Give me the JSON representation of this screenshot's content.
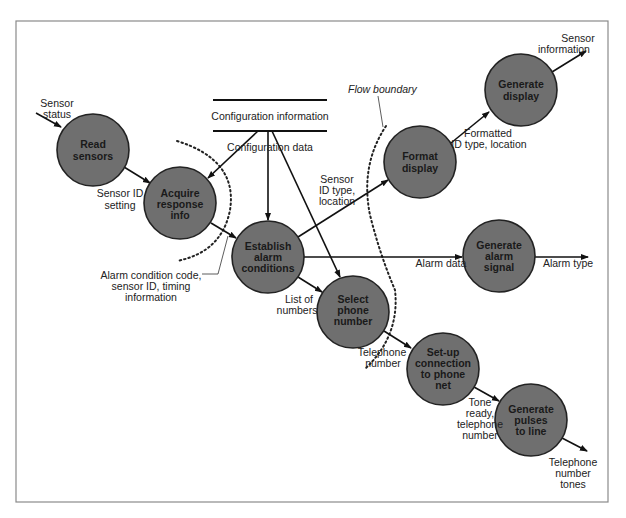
{
  "diagram": {
    "type": "data-flow-diagram",
    "processes": [
      {
        "id": "read_sensors",
        "lines": [
          "Read",
          "sensors"
        ],
        "cx": 93,
        "cy": 150
      },
      {
        "id": "acquire_response_info",
        "lines": [
          "Acquire",
          "response",
          "info"
        ],
        "cx": 180,
        "cy": 203
      },
      {
        "id": "establish_alarm_conditions",
        "lines": [
          "Establish",
          "alarm",
          "conditions"
        ],
        "cx": 268,
        "cy": 257
      },
      {
        "id": "select_phone_number",
        "lines": [
          "Select",
          "phone",
          "number"
        ],
        "cx": 353,
        "cy": 312
      },
      {
        "id": "format_display",
        "lines": [
          "Format",
          "display"
        ],
        "cx": 420,
        "cy": 162
      },
      {
        "id": "generate_display",
        "lines": [
          "Generate",
          "display"
        ],
        "cx": 521,
        "cy": 90
      },
      {
        "id": "generate_alarm_signal",
        "lines": [
          "Generate",
          "alarm",
          "signal"
        ],
        "cx": 499,
        "cy": 256
      },
      {
        "id": "setup_connection",
        "lines": [
          "Set-up",
          "connection",
          "to phone",
          "net"
        ],
        "cx": 443,
        "cy": 369
      },
      {
        "id": "generate_pulses",
        "lines": [
          "Generate",
          "pulses",
          "to line"
        ],
        "cx": 531,
        "cy": 420
      }
    ],
    "data_store": {
      "label": "Configuration information"
    },
    "flow_labels": {
      "sensor_status": [
        "Sensor",
        "status"
      ],
      "sensor_id_setting": [
        "Sensor ID",
        "setting"
      ],
      "configuration_data": [
        "Configuration data"
      ],
      "sensor_id_type_location": [
        "Sensor",
        "ID type,",
        "location"
      ],
      "formatted_id": [
        "Formatted",
        "ID type, location"
      ],
      "sensor_information": [
        "Sensor",
        "information"
      ],
      "alarm_data": [
        "Alarm data"
      ],
      "alarm_type": [
        "Alarm type"
      ],
      "list_of_numbers": [
        "List of",
        "numbers"
      ],
      "telephone_number": [
        "Telephone",
        "number"
      ],
      "tone_ready": [
        "Tone",
        "ready,",
        "telephone",
        "number"
      ],
      "telephone_number_tones": [
        "Telephone",
        "number",
        "tones"
      ],
      "alarm_condition_code": [
        "Alarm condition code,",
        "sensor ID, timing",
        "information"
      ]
    },
    "annotations": {
      "flow_boundary": "Flow boundary"
    }
  }
}
